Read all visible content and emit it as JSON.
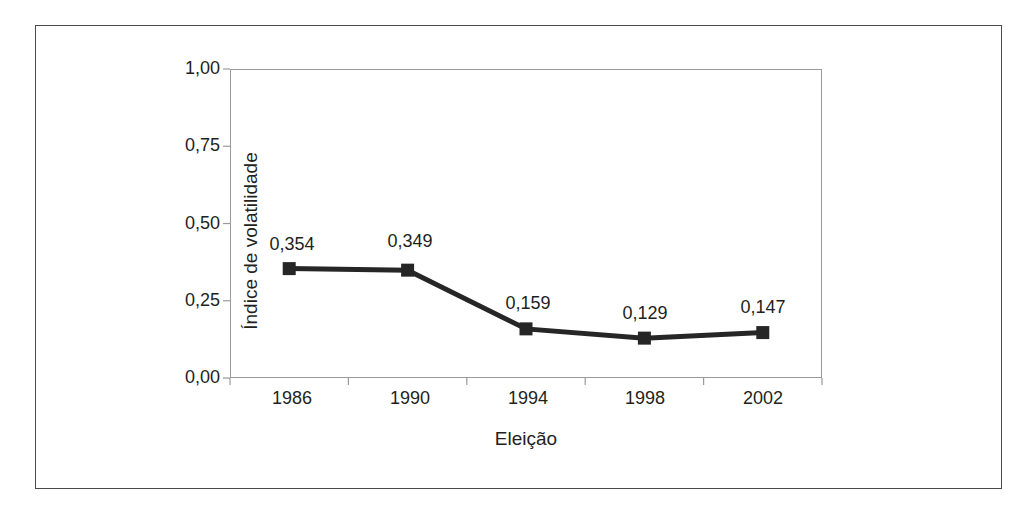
{
  "figure": {
    "background_color": "#ffffff",
    "frame_color": "#4a4a4a",
    "axis_color": "#9a9a9a",
    "series_color": "#262626"
  },
  "chart_data": {
    "type": "line",
    "title": "",
    "subtitle": "",
    "xlabel": "Eleição",
    "ylabel": "Índice de volatilidade",
    "categories": [
      "1986",
      "1990",
      "1994",
      "1998",
      "2002"
    ],
    "values": [
      0.354,
      0.349,
      0.159,
      0.129,
      0.147
    ],
    "data_labels": [
      "0,354",
      "0,349",
      "0,159",
      "0,129",
      "0,147"
    ],
    "ylim": [
      0,
      1
    ],
    "ytick_values": [
      0.0,
      0.25,
      0.5,
      0.75,
      1.0
    ],
    "ytick_labels": [
      "0,00",
      "0,25",
      "0,50",
      "0,75",
      "1,00"
    ],
    "grid": false,
    "legend": false,
    "legend_position": "none",
    "marker": "square",
    "line_style": "solid"
  }
}
